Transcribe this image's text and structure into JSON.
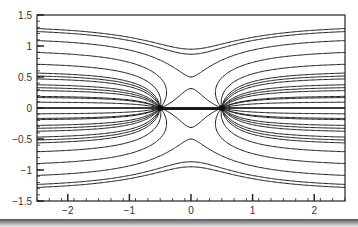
{
  "chart_data": {
    "type": "line",
    "title": "",
    "subtitle": "Streamlines of flow (Rankine oval: uniform flow + source at x=-0.5, sink at x=+0.5)",
    "xlabel": "",
    "ylabel": "",
    "xlim": [
      -2.5,
      2.5
    ],
    "ylim": [
      -1.5,
      1.5
    ],
    "x_ticks": [
      -2,
      -1,
      0,
      1,
      2
    ],
    "x_tick_labels": [
      "−2",
      "−1",
      "0",
      "1",
      "2"
    ],
    "y_ticks": [
      -1.5,
      -1,
      -0.5,
      0,
      0.5,
      1,
      1.5
    ],
    "y_tick_labels": [
      "−1.5",
      "−1",
      "−0.5",
      "0",
      "0.5",
      "1",
      "1.5"
    ],
    "grid": false,
    "legend": null,
    "source_x": -0.5,
    "sink_x": 0.5,
    "uniform_velocity": 1.0,
    "source_strength": 2.6,
    "stagnation_oval_half_length": 0.96,
    "stream_levels": [
      -1.35,
      -1.15,
      -0.95,
      -0.75,
      -0.55,
      -0.35,
      -0.18,
      0,
      0.18,
      0.35,
      0.55,
      0.75,
      0.95,
      1.15,
      1.35,
      -0.1,
      -0.2,
      -0.3,
      -0.4,
      -0.5,
      -0.6,
      0.1,
      0.2,
      0.3,
      0.4,
      0.5,
      0.6,
      1.3,
      -1.3
    ],
    "line_color": "#1a1a1a"
  },
  "axes": {
    "left_px": 37,
    "right_px": 345,
    "top_px": 15,
    "bottom_px": 201
  }
}
